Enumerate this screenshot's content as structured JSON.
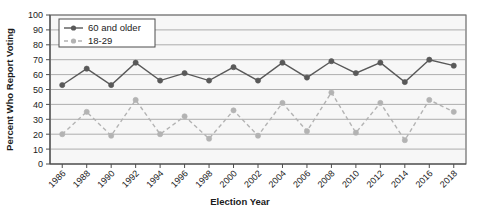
{
  "chart_data": {
    "type": "line",
    "title": "",
    "xlabel": "Election Year",
    "ylabel": "Percent Who Report Voting",
    "categories": [
      "1986",
      "1988",
      "1990",
      "1992",
      "1994",
      "1996",
      "1998",
      "2000",
      "2002",
      "2004",
      "2006",
      "2008",
      "2010",
      "2012",
      "2014",
      "2016",
      "2018"
    ],
    "x": [
      1986,
      1988,
      1990,
      1992,
      1994,
      1996,
      1998,
      2000,
      2002,
      2004,
      2006,
      2008,
      2010,
      2012,
      2014,
      2016,
      2018
    ],
    "ylim": [
      0,
      100
    ],
    "yticks": [
      0,
      10,
      20,
      30,
      40,
      50,
      60,
      70,
      80,
      90,
      100
    ],
    "grid": true,
    "legend_position": "top-left",
    "series": [
      {
        "name": "60 and older",
        "color": "#595959",
        "style": "solid",
        "marker": "circle",
        "values": [
          53,
          64,
          53,
          68,
          56,
          61,
          56,
          65,
          56,
          68,
          58,
          69,
          61,
          68,
          55,
          70,
          66
        ]
      },
      {
        "name": "18-29",
        "color": "#b3b3b3",
        "style": "dashed",
        "marker": "circle",
        "values": [
          20,
          35,
          19,
          43,
          20,
          32,
          17,
          36,
          19,
          41,
          22,
          48,
          21,
          41,
          16,
          43,
          35
        ]
      }
    ]
  },
  "axes": {
    "y_title": "Percent Who Report Voting",
    "x_title": "Election Year"
  },
  "legend": {
    "items": [
      {
        "label": "60 and older"
      },
      {
        "label": "18-29"
      }
    ]
  },
  "colors": {
    "series_older": "#595959",
    "series_young": "#b3b3b3",
    "grid": "#9a9a9a",
    "axis": "#4d4d4d",
    "plot_background": "#f7f7f7",
    "text": "#1b1b1b"
  }
}
